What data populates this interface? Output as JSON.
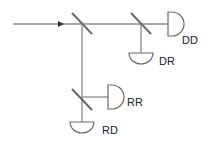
{
  "diagram": {
    "type": "beam-splitter-network",
    "colors": {
      "beam": "#8a8a8a",
      "component": "#6a6a6a",
      "label": "#222222"
    },
    "labels": {
      "dd": "DD",
      "dr": "DR",
      "rr": "RR",
      "rd": "RD"
    }
  }
}
